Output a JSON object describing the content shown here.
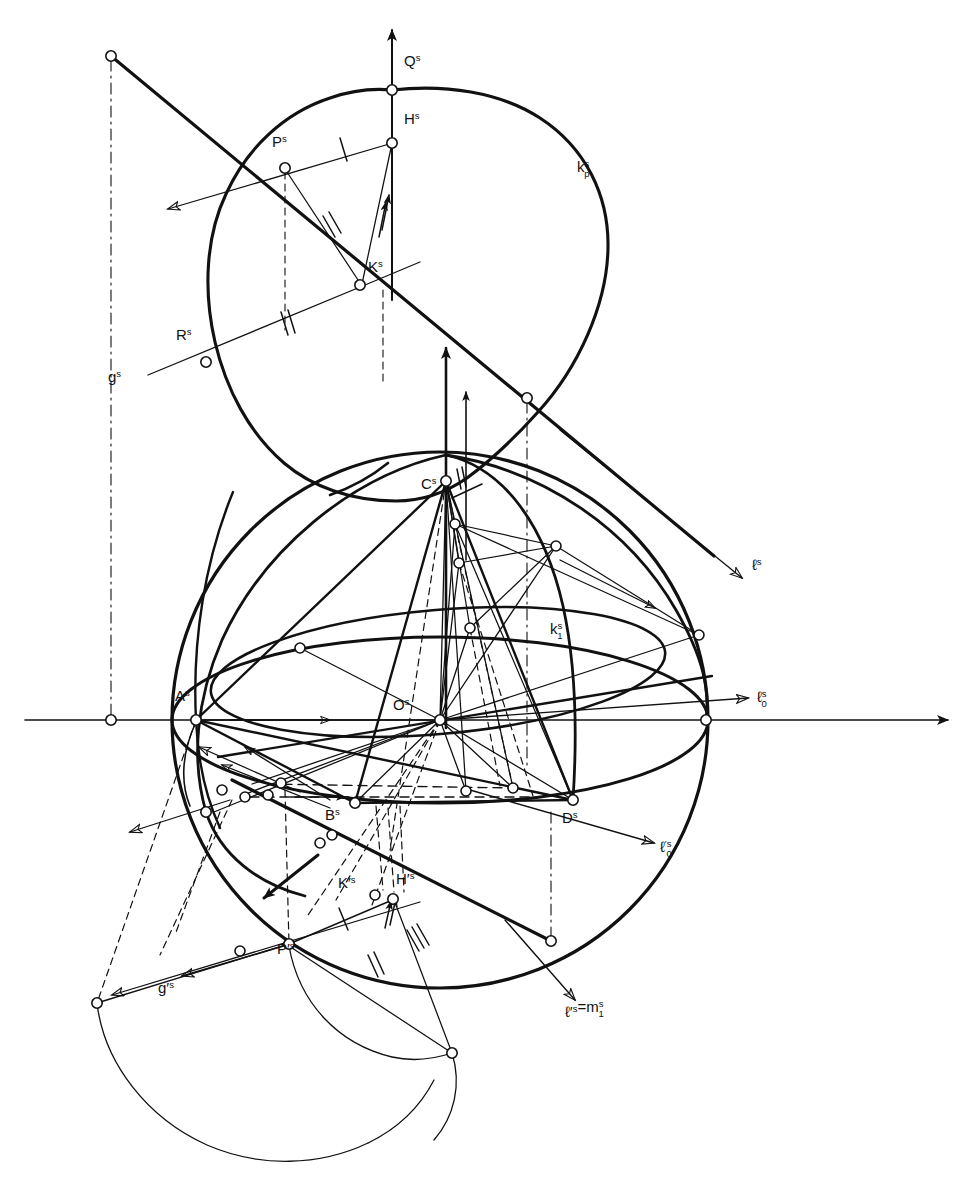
{
  "figure": {
    "kind": "line-drawing",
    "background_color": "#ffffff",
    "ink_color": "#111111",
    "width": 971,
    "height": 1185
  },
  "labels": {
    "Q_s": {
      "base": "Q",
      "sup": "s",
      "sub": "",
      "x": 404,
      "y": 66
    },
    "H_s": {
      "base": "H",
      "sup": "s",
      "sub": "",
      "x": 404,
      "y": 124
    },
    "P_s": {
      "base": "P",
      "sup": "s",
      "sub": "",
      "x": 272,
      "y": 147
    },
    "K_s": {
      "base": "K",
      "sup": "s",
      "sub": "",
      "x": 368,
      "y": 272
    },
    "R_s": {
      "base": "R",
      "sup": "s",
      "sub": "",
      "x": 176,
      "y": 340
    },
    "g_s": {
      "base": "g",
      "sup": "s",
      "sub": "",
      "x": 108,
      "y": 382
    },
    "kp_s": {
      "base": "k",
      "sup": "s",
      "sub": "p",
      "x": 577,
      "y": 172
    },
    "C_s": {
      "base": "C",
      "sup": "s",
      "sub": "",
      "x": 421,
      "y": 489
    },
    "l_s": {
      "base": "ℓ",
      "sup": "s",
      "sub": "",
      "x": 752,
      "y": 570
    },
    "k1_s": {
      "base": "k",
      "sup": "s",
      "sub": "1",
      "x": 550,
      "y": 634
    },
    "l0_s": {
      "base": "ℓ",
      "sup": "s",
      "sub": "0",
      "x": 757,
      "y": 702
    },
    "A_s": {
      "base": "A",
      "sup": "s",
      "sub": "",
      "x": 175,
      "y": 701
    },
    "O_s": {
      "base": "O",
      "sup": "s",
      "sub": "",
      "x": 393,
      "y": 710
    },
    "B_s": {
      "base": "B",
      "sup": "s",
      "sub": "",
      "x": 325,
      "y": 820
    },
    "D_s": {
      "base": "D",
      "sup": "s",
      "sub": "",
      "x": 562,
      "y": 823
    },
    "l0p_s": {
      "base": "ℓ",
      "sup": "′s",
      "sub": "0",
      "x": 660,
      "y": 852
    },
    "Kp_s": {
      "base": "K′",
      "sup": "s",
      "sub": "",
      "x": 338,
      "y": 888
    },
    "Hp_s": {
      "base": "H′",
      "sup": "s",
      "sub": "",
      "x": 396,
      "y": 884
    },
    "Pp_s": {
      "base": "P′",
      "sup": "s",
      "sub": "",
      "x": 277,
      "y": 954
    },
    "gp_s": {
      "base": "g′",
      "sup": "s",
      "sub": "",
      "x": 158,
      "y": 993
    },
    "lp_s_eq_m1": {
      "base": "ℓ′",
      "sup": "s",
      "sub": "",
      "x": 565,
      "y": 1017,
      "tail_base": "=m",
      "tail_sup": "s",
      "tail_sub": "1"
    }
  },
  "axes": {
    "horizontal": {
      "name": "ground-line",
      "x1": 25,
      "y1": 720,
      "x2": 948,
      "y2": 720,
      "arrow": "right"
    },
    "vertical_C": {
      "name": "c-axis",
      "x1": 446,
      "y1": 350,
      "x2": 446,
      "y2": 728,
      "arrow": "up"
    },
    "vertical_Q": {
      "name": "q-axis",
      "x1": 392,
      "y1": 30,
      "x2": 392,
      "y2": 300,
      "arrow": "up"
    }
  },
  "points": {
    "Q": {
      "x": 392,
      "y": 90
    },
    "H": {
      "x": 392,
      "y": 143
    },
    "P": {
      "x": 285,
      "y": 168
    },
    "K": {
      "x": 360,
      "y": 285
    },
    "R": {
      "x": 206,
      "y": 362
    },
    "gTopEnd": {
      "x": 111,
      "y": 56
    },
    "gMid": {
      "x": 527,
      "y": 398
    },
    "C": {
      "x": 446,
      "y": 481
    },
    "A": {
      "x": 196,
      "y": 720
    },
    "O": {
      "x": 440,
      "y": 720
    },
    "B": {
      "x": 355,
      "y": 803
    },
    "D": {
      "x": 573,
      "y": 800
    },
    "E_left": {
      "x": 111,
      "y": 720
    },
    "E_right": {
      "x": 706,
      "y": 720
    },
    "Hp": {
      "x": 393,
      "y": 899
    },
    "Kp": {
      "x": 375,
      "y": 895
    },
    "Pp": {
      "x": 289,
      "y": 944
    },
    "gpLeft": {
      "x": 97,
      "y": 1003
    },
    "gpEnd": {
      "x": 551,
      "y": 941
    },
    "arcEnd": {
      "x": 452,
      "y": 1053
    }
  },
  "sphere": {
    "center": {
      "x": 440,
      "y": 720
    },
    "radius": 268,
    "equator_ry": 83,
    "label": "sphere-outline"
  },
  "legend_marks": {
    "single_tick": "single hatch mark (equal length mark I)",
    "double_tick": "double hatch mark (equal length mark II)",
    "open_circle": "construction point marker",
    "dash_dot": "projection / axis line",
    "dashed": "hidden construction line"
  },
  "colors": {
    "ink": "#111111",
    "paper": "#ffffff"
  }
}
